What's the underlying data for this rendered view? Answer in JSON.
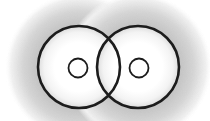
{
  "diagram": {
    "title": "",
    "colors": {
      "background": "#ffffff",
      "outline": "#1c1c1c",
      "halo": "#c4c4c4",
      "halo_fade": "#ffffff",
      "inner": "#ffffff",
      "inner_edge": "#e2e2e2"
    },
    "atoms": [
      {
        "id": "left",
        "orbital": {
          "cx": 79,
          "cy": 67,
          "r": 41
        },
        "nucleus": {
          "cx": 78,
          "cy": 68,
          "r": 9.5
        },
        "halo_r": 74
      },
      {
        "id": "right",
        "orbital": {
          "cx": 138,
          "cy": 67,
          "r": 41
        },
        "nucleus": {
          "cx": 139,
          "cy": 68,
          "r": 9.5
        },
        "halo_r": 74
      }
    ],
    "overlap": {
      "top_intersection": {
        "x": 109,
        "y": 41
      },
      "bottom_intersection": {
        "x": 109,
        "y": 94
      }
    },
    "stroke": {
      "orbital_width": 2.6,
      "nucleus_width": 1.8
    }
  }
}
